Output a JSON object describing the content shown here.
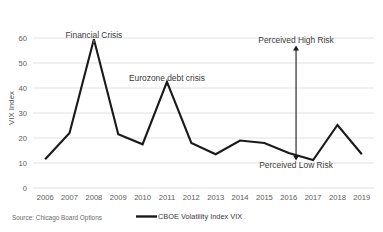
{
  "chart_data": {
    "type": "line",
    "title": "",
    "xlabel": "",
    "ylabel": "VIX Index",
    "categories": [
      "2006",
      "2007",
      "2008",
      "2009",
      "2010",
      "2011",
      "2012",
      "2013",
      "2014",
      "2015",
      "2016",
      "2017",
      "2018",
      "2019"
    ],
    "series": [
      {
        "name": "CBOE Volatility Index VIX",
        "color": "#1a1a1a",
        "values": [
          11.5,
          22.0,
          59.5,
          21.5,
          17.5,
          42.5,
          18.0,
          13.5,
          19.0,
          18.0,
          14.0,
          11.2,
          25.2,
          13.5
        ]
      }
    ],
    "ylim": [
      0,
      60
    ],
    "yticks": [
      0,
      10,
      20,
      30,
      40,
      50,
      60
    ],
    "ytick_labels": [
      "0",
      "10",
      "20",
      "30",
      "40",
      "50",
      "60"
    ],
    "grid": true,
    "legend_position": "bottom",
    "annotations": [
      {
        "id": "financial-crisis",
        "text": "Financial Crisis",
        "x": 2008,
        "y": 60
      },
      {
        "id": "eurozone-debt-crisis",
        "text": "Eurozone debt crisis",
        "x": 2011,
        "y": 43
      },
      {
        "id": "perceived-high-risk",
        "text": "Perceived High Risk",
        "x": 2016.3,
        "y": 58
      },
      {
        "id": "perceived-low-risk",
        "text": "Perceived Low Risk",
        "x": 2016.3,
        "y": 8
      }
    ],
    "risk_arrow": {
      "x": 2016.3,
      "y_top": 57,
      "y_bottom": 11,
      "name": "risk-range-arrow"
    }
  },
  "footer": {
    "source": "Source: Chicago Board Options"
  },
  "legend": {
    "entries": [
      {
        "label": "CBOE Volatility Index VIX",
        "color": "#1a1a1a"
      }
    ]
  },
  "colors": {
    "series": "#1a1a1a",
    "grid": "#d9d9d9",
    "text": "#5a5a5a",
    "background": "#ffffff"
  }
}
